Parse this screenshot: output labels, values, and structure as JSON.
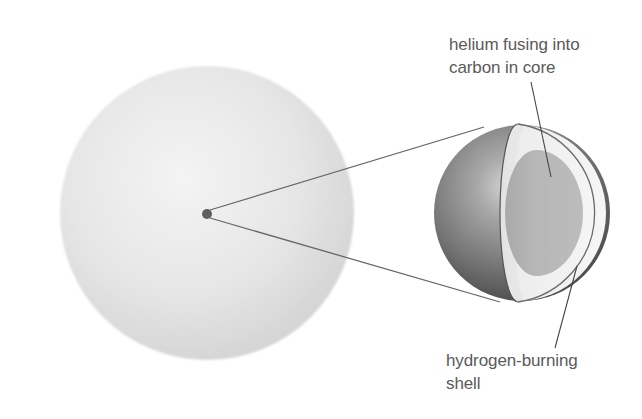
{
  "figure": {
    "colors": {
      "background": "#ffffff",
      "star_center": "#f2f2f2",
      "star_edge": "#d6d6d6",
      "core_dot": "#5e5e5e",
      "sphere_highlight": "#c8c8c8",
      "sphere_mid": "#8a8a8a",
      "sphere_dark": "#4a4a4a",
      "shell_face": "#f4f4f4",
      "core_fill": "#b8b8b8",
      "outline": "#6a6a6a",
      "label_text": "#5a5a5a"
    }
  },
  "labels": {
    "core": {
      "line1": "helium fusing into",
      "line2": "carbon in core"
    },
    "shell": {
      "line1": "hydrogen-burning",
      "line2": "shell"
    }
  }
}
